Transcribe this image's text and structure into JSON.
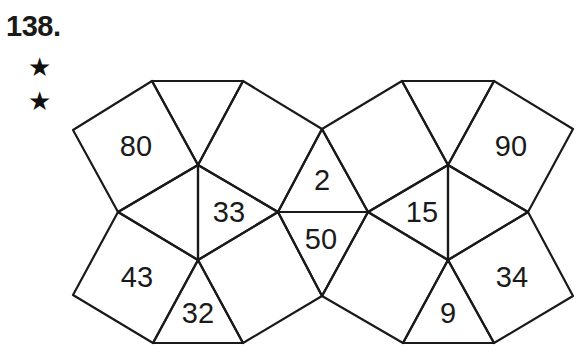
{
  "problem": {
    "number_label": "138.",
    "difficulty_stars": 2,
    "star_glyph": "★"
  },
  "puzzle": {
    "type": "polygon-number-puzzle",
    "cells": [
      {
        "id": "left-top-square",
        "value": "80"
      },
      {
        "id": "left-center-triangle",
        "value": "33"
      },
      {
        "id": "left-bottom-square",
        "value": "43"
      },
      {
        "id": "left-bottom-triangle",
        "value": "32"
      },
      {
        "id": "middle-top-triangle",
        "value": "2"
      },
      {
        "id": "middle-bottom-triangle",
        "value": "50"
      },
      {
        "id": "right-center-triangle",
        "value": "15"
      },
      {
        "id": "right-top-square",
        "value": "90"
      },
      {
        "id": "right-bottom-square",
        "value": "34"
      },
      {
        "id": "right-bottom-triangle",
        "value": "9"
      }
    ]
  }
}
